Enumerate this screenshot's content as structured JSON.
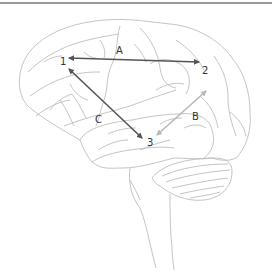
{
  "diagram": {
    "nodes": [
      {
        "id": "1",
        "label": "1",
        "x": 64,
        "y": 62
      },
      {
        "id": "2",
        "label": "2",
        "x": 206,
        "y": 71
      },
      {
        "id": "3",
        "label": "3",
        "x": 151,
        "y": 143
      }
    ],
    "connections": [
      {
        "id": "A",
        "label": "A",
        "from": "1",
        "to": "2",
        "style": "dark",
        "direction": "bidirectional"
      },
      {
        "id": "B",
        "label": "B",
        "from": "3",
        "to": "2",
        "style": "light",
        "direction": "bidirectional"
      },
      {
        "id": "C",
        "label": "C",
        "from": "1",
        "to": "3",
        "style": "dark",
        "direction": "bidirectional"
      }
    ],
    "colors": {
      "outline": "#b5b5b5",
      "arrow_dark": "#555555",
      "arrow_light": "#b8b8b8",
      "text": "#333333",
      "top_rule": "#9a9a9a"
    }
  }
}
